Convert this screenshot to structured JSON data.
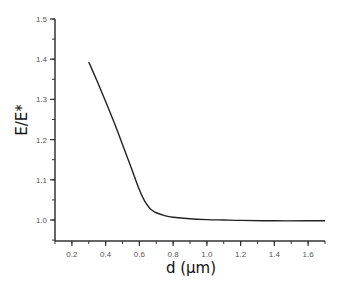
{
  "chart_data": {
    "type": "line",
    "title": "",
    "xlabel": "d (μm)",
    "ylabel": "E/E*",
    "xlim": [
      0.1,
      1.7
    ],
    "ylim": [
      0.947,
      1.5
    ],
    "grid": false,
    "legend": "none",
    "x_ticks": [
      0.2,
      0.4,
      0.6,
      0.8,
      1.0,
      1.2,
      1.4,
      1.6
    ],
    "x_tick_labels": [
      "0.2",
      "0.4",
      "0.6",
      "0.8",
      "1.0",
      "1.2",
      "1.4",
      "1.6"
    ],
    "x_minor_step": 0.1,
    "y_ticks": [
      1.0,
      1.1,
      1.2,
      1.3,
      1.4,
      1.5
    ],
    "y_tick_labels": [
      "1.0",
      "1.1",
      "1.2",
      "1.3",
      "1.4",
      "1.5"
    ],
    "y_minor_step": 0.05,
    "series": [
      {
        "name": "E/E*",
        "color": "#222222",
        "x": [
          0.3,
          0.35,
          0.4,
          0.45,
          0.5,
          0.55,
          0.6,
          0.63,
          0.66,
          0.68,
          0.7,
          0.75,
          0.8,
          0.9,
          1.0,
          1.1,
          1.2,
          1.4,
          1.6,
          1.7
        ],
        "y": [
          1.393,
          1.345,
          1.295,
          1.243,
          1.188,
          1.132,
          1.075,
          1.048,
          1.03,
          1.023,
          1.018,
          1.011,
          1.007,
          1.003,
          1.001,
          1.0,
          0.999,
          0.998,
          0.998,
          0.998
        ]
      }
    ]
  }
}
